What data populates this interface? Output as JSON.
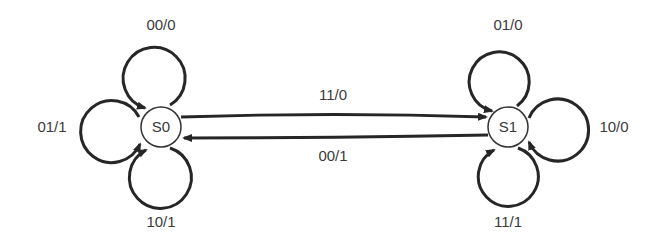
{
  "diagram": {
    "type": "state-transition-diagram",
    "states": [
      {
        "id": "S0",
        "label": "S0"
      },
      {
        "id": "S1",
        "label": "S1"
      }
    ],
    "transitions": [
      {
        "from": "S0",
        "to": "S0",
        "label": "00/0",
        "position": "top"
      },
      {
        "from": "S0",
        "to": "S0",
        "label": "01/1",
        "position": "left"
      },
      {
        "from": "S0",
        "to": "S0",
        "label": "10/1",
        "position": "bottom"
      },
      {
        "from": "S0",
        "to": "S1",
        "label": "11/0",
        "position": "upper"
      },
      {
        "from": "S1",
        "to": "S0",
        "label": "00/1",
        "position": "lower"
      },
      {
        "from": "S1",
        "to": "S1",
        "label": "01/0",
        "position": "top"
      },
      {
        "from": "S1",
        "to": "S1",
        "label": "10/0",
        "position": "right"
      },
      {
        "from": "S1",
        "to": "S1",
        "label": "11/1",
        "position": "bottom"
      }
    ]
  },
  "colors": {
    "edge": "#262626",
    "text": "#3a3a3a",
    "background": "#ffffff"
  }
}
